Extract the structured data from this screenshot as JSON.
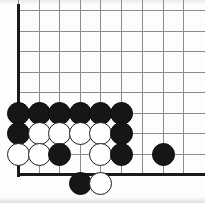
{
  "figure": {
    "kind": "go-board-diagram",
    "title": "Go board corner position",
    "width": 205,
    "height": 203,
    "background_color": "#fdfdfd"
  },
  "board": {
    "corner": "bottom-left",
    "grid_origin_x": 18,
    "grid_origin_y": 10,
    "grid_spacing": 20.6,
    "columns": 9,
    "rows": 9,
    "grid_line_color": "#8c8c8c",
    "edge_line_color": "#1a1a1a",
    "edge_left_x": 18,
    "edge_bottom_y": 174,
    "column_x": [
      18,
      39,
      59,
      80,
      100,
      121,
      142,
      163,
      183
    ],
    "row_y": [
      10,
      31,
      51,
      72,
      92,
      113,
      133,
      154,
      174
    ]
  },
  "colors": {
    "black_stone": "#161616",
    "white_stone": "#ffffff",
    "stone_outline": "#1a1a1a",
    "grid": "#8c8c8c",
    "edge": "#1a1a1a"
  },
  "stones": [
    {
      "id": "b1",
      "color": "black",
      "col": 1,
      "row": 6,
      "x": 18,
      "y": 113,
      "on_board": true
    },
    {
      "id": "b2",
      "color": "black",
      "col": 2,
      "row": 6,
      "x": 39,
      "y": 113,
      "on_board": true
    },
    {
      "id": "b3",
      "color": "black",
      "col": 3,
      "row": 6,
      "x": 59,
      "y": 113,
      "on_board": true
    },
    {
      "id": "b4",
      "color": "black",
      "col": 4,
      "row": 6,
      "x": 80,
      "y": 113,
      "on_board": true
    },
    {
      "id": "b5",
      "color": "black",
      "col": 5,
      "row": 6,
      "x": 100,
      "y": 113,
      "on_board": true
    },
    {
      "id": "b6",
      "color": "black",
      "col": 6,
      "row": 6,
      "x": 121,
      "y": 113,
      "on_board": true
    },
    {
      "id": "b7",
      "color": "black",
      "col": 1,
      "row": 7,
      "x": 18,
      "y": 133,
      "on_board": true
    },
    {
      "id": "w1",
      "color": "white",
      "col": 2,
      "row": 7,
      "x": 39,
      "y": 133,
      "on_board": true
    },
    {
      "id": "w2",
      "color": "white",
      "col": 3,
      "row": 7,
      "x": 59,
      "y": 133,
      "on_board": true
    },
    {
      "id": "w3",
      "color": "white",
      "col": 4,
      "row": 7,
      "x": 80,
      "y": 133,
      "on_board": true
    },
    {
      "id": "w4",
      "color": "white",
      "col": 5,
      "row": 7,
      "x": 100,
      "y": 133,
      "on_board": true
    },
    {
      "id": "b8",
      "color": "black",
      "col": 6,
      "row": 7,
      "x": 121,
      "y": 133,
      "on_board": true
    },
    {
      "id": "w5",
      "color": "white",
      "col": 1,
      "row": 8,
      "x": 18,
      "y": 154,
      "on_board": true
    },
    {
      "id": "w6",
      "color": "white",
      "col": 2,
      "row": 8,
      "x": 39,
      "y": 154,
      "on_board": true
    },
    {
      "id": "b9",
      "color": "black",
      "col": 3,
      "row": 8,
      "x": 59,
      "y": 154,
      "on_board": true
    },
    {
      "id": "w7",
      "color": "white",
      "col": 5,
      "row": 8,
      "x": 100,
      "y": 154,
      "on_board": true
    },
    {
      "id": "b10",
      "color": "black",
      "col": 6,
      "row": 8,
      "x": 121,
      "y": 154,
      "on_board": true
    },
    {
      "id": "b11",
      "color": "black",
      "col": 8,
      "row": 8,
      "x": 163,
      "y": 154,
      "on_board": true
    },
    {
      "id": "b12",
      "color": "black",
      "col": 4,
      "row": 0,
      "x": 80,
      "y": 183,
      "on_board": false
    },
    {
      "id": "w8",
      "color": "white",
      "col": 5,
      "row": 0,
      "x": 100,
      "y": 183,
      "on_board": false
    }
  ],
  "empty_intersections": [
    {
      "col": 4,
      "row": 8,
      "x": 80,
      "y": 154
    }
  ],
  "counts": {
    "black_stones": 13,
    "white_stones": 8,
    "off_board_stones": 2
  }
}
